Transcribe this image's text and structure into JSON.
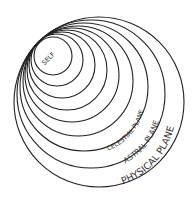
{
  "diagram": {
    "type": "nested-tangent-circles",
    "ring_count": 9,
    "stroke_color": "#222222",
    "background": "#ffffff",
    "labels": [
      {
        "id": "self",
        "text": "SELF"
      },
      {
        "id": "celestial",
        "text": "CELESTIAL PLANE"
      },
      {
        "id": "astral",
        "text": "ASTRAL PLANE"
      },
      {
        "id": "physical",
        "text": "PHYSICAL PLANE"
      }
    ]
  }
}
